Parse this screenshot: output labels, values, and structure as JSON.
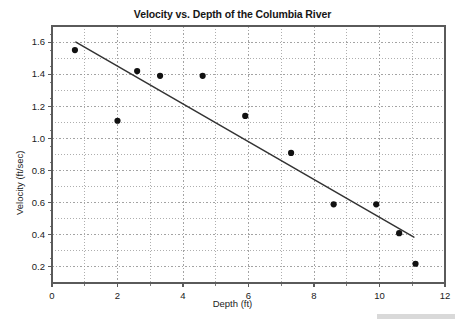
{
  "chart_data": {
    "type": "scatter",
    "title": "Velocity vs. Depth of the Columbia River",
    "xlabel": "Depth (ft)",
    "ylabel": "Velocity (ft/sec)",
    "xlim": [
      0,
      12
    ],
    "ylim": [
      0.1,
      1.7
    ],
    "xticks": [
      0,
      2,
      4,
      6,
      8,
      10,
      12
    ],
    "xtick_labels": [
      "0",
      "2",
      "4",
      "6",
      "8",
      "10",
      "12"
    ],
    "x_minor_step": 1,
    "yticks": [
      0.2,
      0.4,
      0.6,
      0.8,
      1.0,
      1.2,
      1.4,
      1.6
    ],
    "ytick_labels": [
      "0.2",
      "0.4",
      "0.6",
      "0.8",
      "1.0",
      "1.2",
      "1.4",
      "1.6"
    ],
    "y_minor_step": 0.1,
    "grid": true,
    "grid_style": "dotted",
    "legend": "none",
    "marker": "filled-circle",
    "marker_color": "#111111",
    "points": [
      {
        "x": 0.7,
        "y": 1.55
      },
      {
        "x": 2.0,
        "y": 1.11
      },
      {
        "x": 2.6,
        "y": 1.42
      },
      {
        "x": 3.3,
        "y": 1.39
      },
      {
        "x": 4.6,
        "y": 1.39
      },
      {
        "x": 5.9,
        "y": 1.14
      },
      {
        "x": 7.3,
        "y": 0.91
      },
      {
        "x": 8.6,
        "y": 0.59
      },
      {
        "x": 9.9,
        "y": 0.59
      },
      {
        "x": 10.6,
        "y": 0.41
      },
      {
        "x": 11.1,
        "y": 0.22
      }
    ],
    "trendline": {
      "type": "linear-fit",
      "color": "#333333",
      "x_start": 0.73,
      "y_start": 1.6,
      "x_end": 11.05,
      "y_end": 0.385
    }
  },
  "colors": {
    "frame": "#5a5a5a",
    "grid": "#8c8c8c",
    "text": "#1a1a1a",
    "background": "#ffffff",
    "artifact": "#d9d9d9"
  }
}
